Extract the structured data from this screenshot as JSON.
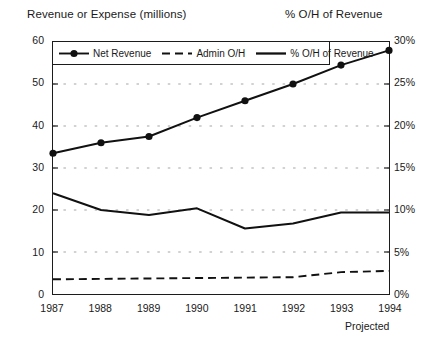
{
  "titles": {
    "left_axis_title": "Revenue or Expense (millions)",
    "right_axis_title": "% O/H of Revenue"
  },
  "footnote": "Projected",
  "legend": {
    "items": [
      {
        "label": "Net Revenue",
        "style": "solid-with-marker",
        "color": "#111111"
      },
      {
        "label": "Admin O/H",
        "style": "dashed",
        "color": "#111111"
      },
      {
        "label": "% O/H of Revenue",
        "style": "solid-thick",
        "color": "#111111"
      }
    ]
  },
  "axes": {
    "left_ticks": [
      "0",
      "10",
      "20",
      "30",
      "40",
      "50",
      "60"
    ],
    "right_ticks": [
      "0%",
      "5%",
      "10%",
      "15%",
      "20%",
      "25%",
      "30%"
    ],
    "x_ticks": [
      "1987",
      "1988",
      "1989",
      "1990",
      "1991",
      "1992",
      "1993",
      "1994"
    ]
  },
  "colors": {
    "line": "#111111",
    "frame": "#1c1c1c",
    "grid": "#9a9a9a",
    "text": "#1a1a1a",
    "background": "#ffffff"
  },
  "chart_data": {
    "type": "line",
    "title": "",
    "xlabel": "",
    "ylabel": "Revenue or Expense (millions)",
    "y2label": "% O/H of Revenue",
    "categories": [
      "1987",
      "1988",
      "1989",
      "1990",
      "1991",
      "1992",
      "1993",
      "1994"
    ],
    "ylim": [
      0,
      60
    ],
    "y2lim": [
      0,
      30
    ],
    "yticks": [
      0,
      10,
      20,
      30,
      40,
      50,
      60
    ],
    "y2ticks": [
      0,
      5,
      10,
      15,
      20,
      25,
      30
    ],
    "grid": true,
    "legend_position": "top-left-inside",
    "annotations": [
      "Projected"
    ],
    "series": [
      {
        "name": "Net Revenue",
        "axis": "left",
        "units": "millions",
        "markers": true,
        "values": [
          33.5,
          36.0,
          37.5,
          42.0,
          46.0,
          50.0,
          54.5,
          58.0
        ]
      },
      {
        "name": "Admin O/H",
        "axis": "left",
        "units": "millions",
        "markers": false,
        "values": [
          3.5,
          3.6,
          3.7,
          3.8,
          3.9,
          4.0,
          5.2,
          5.5
        ]
      },
      {
        "name": "% O/H of Revenue",
        "axis": "right",
        "units": "percent",
        "markers": false,
        "values": [
          12.0,
          10.0,
          9.4,
          10.2,
          7.8,
          8.4,
          9.7,
          9.7
        ]
      }
    ]
  }
}
